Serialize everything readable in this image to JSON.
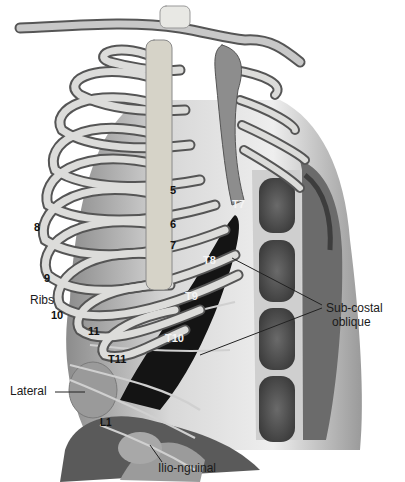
{
  "figure": {
    "labels": {
      "rib_5": "5",
      "rib_6": "6",
      "rib_7": "7",
      "rib_8": "8",
      "rib_9": "9",
      "rib_10": "10",
      "rib_11": "11",
      "ribs": "Ribs",
      "t7": "T7",
      "t8": "T8",
      "t9": "T9",
      "t10": "T10",
      "t11": "T11",
      "l1": "L1",
      "lateral": "Lateral",
      "subcostal_line1": "Sub-costal",
      "subcostal_line2": "oblique",
      "ilioinguinal": "Ilio-nguinal"
    },
    "colors": {
      "background": "#ffffff",
      "bone": "#d9d9d6",
      "bone_shadow": "#6e6e6e",
      "muscle": "#5a5a5a",
      "muscle_light": "#a8a8a8",
      "block_region": "#141414",
      "lateral_region": "#9a9a9a",
      "text": "#111111"
    }
  }
}
